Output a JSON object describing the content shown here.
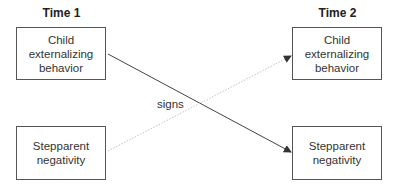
{
  "diagram": {
    "columns": [
      {
        "label": "Time 1"
      },
      {
        "label": "Time 2"
      }
    ],
    "nodes": {
      "t1_child": {
        "lines": [
          "Child",
          "externalizing",
          "behavior"
        ]
      },
      "t1_step": {
        "lines": [
          "Stepparent",
          "negativity"
        ]
      },
      "t2_child": {
        "lines": [
          "Child",
          "externalizing",
          "behavior"
        ]
      },
      "t2_step": {
        "lines": [
          "Stepparent",
          "negativity"
        ]
      }
    },
    "edges": [
      {
        "from": "Time 1 Child externalizing behavior",
        "to": "Time 2 Stepparent negativity",
        "style": "solid"
      },
      {
        "from": "Time 1 Stepparent negativity",
        "to": "Time 2 Child externalizing behavior",
        "style": "dotted"
      }
    ],
    "edge_label": "signs",
    "colors": {
      "solid_edge": "#444444",
      "dotted_edge": "#bbbbbb",
      "box_border": "#555555"
    }
  }
}
